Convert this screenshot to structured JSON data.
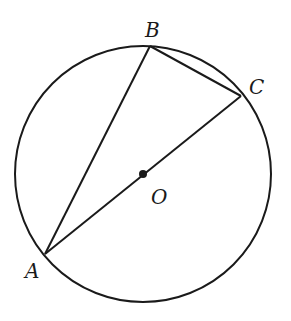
{
  "diagram": {
    "type": "circle-inscribed-triangle",
    "circle": {
      "center_label": "O",
      "cx": 143,
      "cy": 174,
      "r": 128
    },
    "points": {
      "A": {
        "label": "A",
        "x": 45,
        "y": 254
      },
      "B": {
        "label": "B",
        "x": 150,
        "y": 46
      },
      "C": {
        "label": "C",
        "x": 241,
        "y": 96
      },
      "O": {
        "label": "O",
        "x": 143,
        "y": 174
      }
    },
    "segments": [
      "AB",
      "BC",
      "AC"
    ]
  },
  "labels": {
    "A": "A",
    "B": "B",
    "C": "C",
    "O": "O"
  },
  "colors": {
    "stroke": "#1a1a1a",
    "background": "#ffffff"
  }
}
